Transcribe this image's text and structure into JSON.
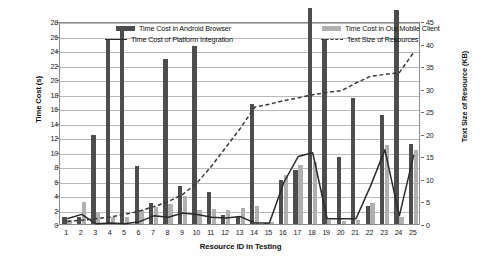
{
  "chart_data": {
    "type": "bar",
    "title": "",
    "xlabel": "Resource ID in Testing",
    "ylabel": "Time Cost (s)",
    "y2label": "Text Size of Resource (KB)",
    "ylim": [
      0,
      28
    ],
    "y2lim": [
      0,
      45
    ],
    "ytick_step": 2,
    "y2tick_step": 5,
    "grid": true,
    "legend_position": "top-inside",
    "categories": [
      1,
      2,
      3,
      4,
      5,
      6,
      7,
      8,
      9,
      10,
      11,
      12,
      13,
      14,
      15,
      16,
      17,
      18,
      19,
      20,
      21,
      22,
      23,
      24,
      25
    ],
    "yticks": [
      0,
      2,
      4,
      6,
      8,
      10,
      12,
      14,
      16,
      18,
      20,
      22,
      24,
      26,
      28
    ],
    "y2ticks": [
      0,
      5,
      10,
      15,
      20,
      25,
      30,
      35,
      40,
      45
    ],
    "series": [
      {
        "name": "Time Cost in Android Browser",
        "type": "bar",
        "axis": "left",
        "color": "#4d4d4d",
        "values": [
          1.0,
          0.9,
          12.3,
          25.5,
          26.7,
          8.0,
          2.9,
          22.8,
          5.2,
          24.6,
          4.4,
          1.2,
          1.1,
          16.6,
          0.2,
          6.1,
          7.5,
          29.8,
          25.5,
          9.3,
          17.4,
          2.5,
          15.1,
          29.5,
          11.0
        ]
      },
      {
        "name": "Time Cost in Our Mobile Client",
        "type": "bar",
        "axis": "left",
        "color": "#b0b0b0",
        "values": [
          0.6,
          3.0,
          1.6,
          1.0,
          0.9,
          2.0,
          2.3,
          2.7,
          3.9,
          2.0,
          2.1,
          2.0,
          2.2,
          2.5,
          0.3,
          6.7,
          8.1,
          8.6,
          0.5,
          0.4,
          0.6,
          2.9,
          10.9,
          0.9,
          10.2
        ]
      },
      {
        "name": "Time Cost of Platform Integration",
        "type": "line",
        "axis": "left",
        "color": "#2b2b2b",
        "values": [
          1.0,
          1.6,
          0.3,
          0.4,
          0.3,
          0.6,
          1.4,
          1.2,
          1.8,
          1.6,
          1.2,
          1.1,
          1.3,
          0.4,
          0.4,
          6.0,
          9.6,
          10.1,
          1.0,
          1.0,
          1.0,
          5.5,
          10.5,
          1.4,
          9.8
        ]
      },
      {
        "name": "Text Size of Resources",
        "type": "line-dashed",
        "axis": "right",
        "color": "#3a3a3a",
        "values": [
          1.0,
          1.3,
          1.6,
          2.0,
          2.6,
          3.3,
          4.3,
          5.4,
          7.0,
          9.6,
          13.3,
          17.5,
          21.7,
          26.4,
          27.0,
          27.8,
          28.4,
          29.1,
          29.6,
          30.0,
          31.7,
          33.2,
          33.6,
          34.0,
          38.5
        ]
      }
    ],
    "legend": [
      {
        "label": "Time Cost in Android Browser",
        "marker": "bar-dark"
      },
      {
        "label": "Time Cost in Our Mobile Client",
        "marker": "bar-light"
      },
      {
        "label": "Time Cost of Platform Integration",
        "marker": "line-solid"
      },
      {
        "label": "Text Size of Resources",
        "marker": "line-dashed"
      }
    ]
  }
}
